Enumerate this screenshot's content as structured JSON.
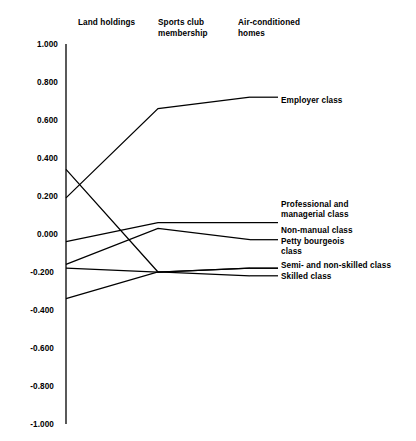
{
  "chart_data": {
    "type": "line",
    "title": "",
    "subtitle": "",
    "xlabel": "",
    "ylabel": "",
    "categories": [
      "Land holdings",
      "Sports club membership",
      "Air-conditioned homes"
    ],
    "ylim": [
      -1.0,
      1.0
    ],
    "ytick_labels": [
      "1.000",
      "0.800",
      "0.600",
      "0.400",
      "0.200",
      "0.000",
      "-0.200",
      "-0.400",
      "-0.600",
      "-0.800",
      "-1.000"
    ],
    "ytick_values": [
      1.0,
      0.8,
      0.6,
      0.4,
      0.2,
      0.0,
      -0.2,
      -0.4,
      -0.6,
      -0.8,
      -1.0
    ],
    "grid": false,
    "legend_position": "right-inline",
    "series": [
      {
        "name": "Employer class",
        "values": [
          0.19,
          0.66,
          0.72
        ]
      },
      {
        "name": "Professional and managerial class",
        "values": [
          -0.04,
          0.06,
          0.06
        ]
      },
      {
        "name": "Non-manual class",
        "values": [
          -0.16,
          0.03,
          -0.03
        ]
      },
      {
        "name": "Petty bourgeois class",
        "values": [
          0.34,
          -0.2,
          -0.18
        ]
      },
      {
        "name": "Semi- and non-skilled class",
        "values": [
          -0.18,
          -0.2,
          -0.18
        ]
      },
      {
        "name": "Skilled class",
        "values": [
          -0.34,
          -0.2,
          -0.22
        ]
      }
    ]
  },
  "axis": {
    "labels": [
      "1.000",
      "0.800",
      "0.600",
      "0.400",
      "0.200",
      "0.000",
      "-0.200",
      "-0.400",
      "-0.600",
      "-0.800",
      "-1.000"
    ]
  },
  "columns": [
    {
      "label": "Land holdings"
    },
    {
      "label": "Sports club\nmembership"
    },
    {
      "label": "Air-conditioned\nhomes"
    }
  ],
  "series_labels": [
    {
      "text": "Employer class"
    },
    {
      "text": "Professional and\nmanagerial class"
    },
    {
      "text": "Non-manual class"
    },
    {
      "text": "Petty bourgeois\nclass"
    },
    {
      "text": "Semi- and non-skilled class"
    },
    {
      "text": "Skilled class"
    }
  ],
  "colors": {
    "line": "#000000",
    "axis": "#000000",
    "background": "#ffffff",
    "text": "#000000"
  }
}
